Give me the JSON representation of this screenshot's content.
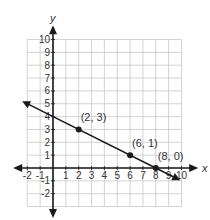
{
  "chart_data": {
    "type": "line",
    "title": "",
    "xlabel": "x",
    "ylabel": "y",
    "xlim": [
      -2,
      10
    ],
    "ylim": [
      -2,
      10
    ],
    "grid": true,
    "x_ticks": [
      "-2",
      "-1",
      "1",
      "2",
      "3",
      "4",
      "5",
      "6",
      "7",
      "8",
      "9",
      "10"
    ],
    "y_ticks": [
      "10",
      "9",
      "8",
      "7",
      "6",
      "5",
      "4",
      "3",
      "2",
      "1",
      "-1",
      "-2"
    ],
    "line": {
      "equation_points": [
        [
          -2,
          5
        ],
        [
          10,
          -1
        ]
      ],
      "arrows": "both ends",
      "description": "line through (2,3), (6,1), (8,0)"
    },
    "points": [
      {
        "x": 2,
        "y": 3,
        "label": "(2, 3)"
      },
      {
        "x": 6,
        "y": 1,
        "label": "(6, 1)"
      },
      {
        "x": 8,
        "y": 0,
        "label": "(8, 0)"
      }
    ],
    "colors": {
      "grid": "#c8c8c8",
      "axis": "#1a1a1a",
      "line": "#1a1a1a",
      "text": "#333333"
    }
  }
}
